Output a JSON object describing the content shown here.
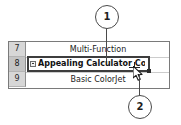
{
  "spreadsheet": {
    "rows": [
      {
        "number": "7",
        "value": "Multi-Function",
        "selected": false
      },
      {
        "number": "8",
        "value": "Appealing Calculator Corp.",
        "selected": true
      },
      {
        "number": "9",
        "value": "Basic ColorJet",
        "selected": false
      }
    ],
    "selected_cell": {
      "row_number": "8",
      "text": "Appealing Calculator Corp.",
      "expand_icon": "minus-box-icon",
      "fill_handle": "fill-handle"
    }
  },
  "cursor": {
    "type": "crosshair-fill-cursor",
    "pointer": "arrow-pointer-icon"
  },
  "callouts": [
    {
      "label": "1",
      "target": "selected-cell-top-edge"
    },
    {
      "label": "2",
      "target": "fill-handle"
    }
  ],
  "colors": {
    "row_header_bg": "#d7d7d7",
    "row_header_selected_bg": "#c4c4c4",
    "grid_line": "#cccccc",
    "frame_border": "#7a7a7a",
    "selection_border": "#3d3d3d",
    "callout_stroke": "#4a4a4a",
    "text": "#1b1b1b"
  }
}
